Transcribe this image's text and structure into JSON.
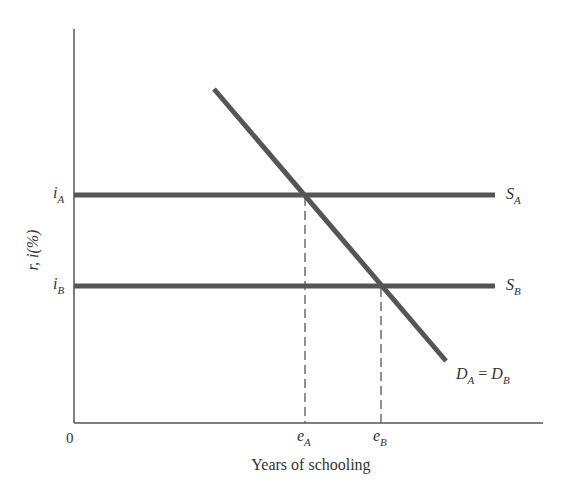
{
  "diagram": {
    "type": "supply-demand-schooling",
    "colors": {
      "axis": "#555555",
      "curve": "#555555",
      "text": "#333333"
    },
    "axes": {
      "origin_label": "0",
      "x_label": "Years of schooling",
      "y_label": "r, i(%)"
    },
    "y_ticks": [
      {
        "base": "i",
        "sub": "A"
      },
      {
        "base": "i",
        "sub": "B"
      }
    ],
    "x_ticks": [
      {
        "base": "e",
        "sub": "A"
      },
      {
        "base": "e",
        "sub": "B"
      }
    ],
    "curves": {
      "supply_A": {
        "base": "S",
        "sub": "A"
      },
      "supply_B": {
        "base": "S",
        "sub": "B"
      },
      "demand": {
        "left_base": "D",
        "left_sub": "A",
        "eq": " = ",
        "right_base": "D",
        "right_sub": "B"
      }
    }
  }
}
